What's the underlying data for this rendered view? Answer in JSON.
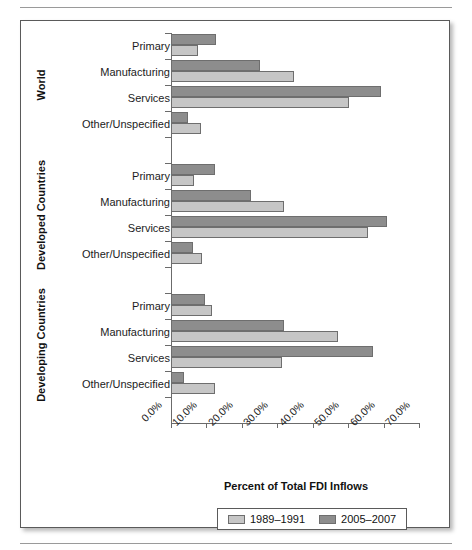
{
  "chart_data": {
    "type": "bar",
    "orientation": "horizontal",
    "title": "",
    "xlabel": "Percent of Total FDI Inflows",
    "ylabel": "",
    "xlim": [
      0,
      70
    ],
    "xunit": "%",
    "grid": false,
    "legend_position": "bottom",
    "xticklabels": [
      "0.0%",
      "10.0%",
      "20.0%",
      "30.0%",
      "40.0%",
      "50.0%",
      "60.0%",
      "70.0%"
    ],
    "xticks": [
      0,
      10,
      20,
      30,
      40,
      50,
      60,
      70
    ],
    "series": [
      {
        "name": "1989–1991",
        "color": "#c6c6c6"
      },
      {
        "name": "2005–2007",
        "color": "#8d8d8d"
      }
    ],
    "groups": [
      {
        "label": "World",
        "categories": [
          "Primary",
          "Manufacturing",
          "Services",
          "Other/Unspecified"
        ],
        "values_1989_1991": [
          7.5,
          34.7,
          50.2,
          8.6
        ],
        "values_2005_2007": [
          12.6,
          25.0,
          59.4,
          4.9
        ]
      },
      {
        "label": "Developed Countries",
        "categories": [
          "Primary",
          "Manufacturing",
          "Services",
          "Other/Unspecified"
        ],
        "values_1989_1991": [
          6.6,
          31.9,
          55.7,
          8.7
        ],
        "values_2005_2007": [
          12.4,
          22.5,
          60.9,
          6.2
        ]
      },
      {
        "label": "Developing Countries",
        "categories": [
          "Primary",
          "Manufacturing",
          "Services",
          "Other/Unspecified"
        ],
        "values_1989_1991": [
          11.5,
          47.0,
          31.4,
          12.4
        ],
        "values_2005_2007": [
          9.7,
          31.9,
          57.0,
          3.7
        ]
      }
    ]
  },
  "axis": {
    "x_title": "Percent of Total FDI Inflows",
    "ticks": [
      "0.0%",
      "10.0%",
      "20.0%",
      "30.0%",
      "40.0%",
      "50.0%",
      "60.0%",
      "70.0%"
    ]
  },
  "groups": {
    "world": "World",
    "developed": "Developed Countries",
    "developing": "Developing Countries"
  },
  "categories": {
    "primary": "Primary",
    "manufacturing": "Manufacturing",
    "services": "Services",
    "other": "Other/Unspecified"
  },
  "legend": {
    "series_1": "1989–1991",
    "series_2": "2005–2007"
  },
  "colors": {
    "series_1": "#c6c6c6",
    "series_2": "#8d8d8d",
    "frame": "#5a5a5a",
    "axis": "#6b6b6b",
    "text": "#1c1c1c"
  }
}
